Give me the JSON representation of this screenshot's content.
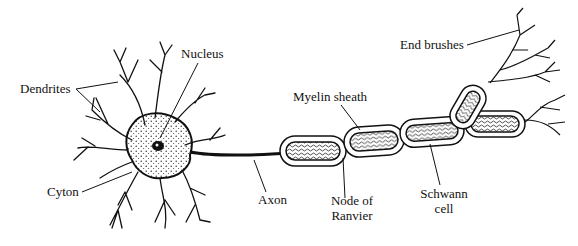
{
  "diagram": {
    "labels": {
      "nucleus": "Nucleus",
      "dendrites": "Dendrites",
      "cyton": "Cyton",
      "axon": "Axon",
      "myelin_sheath": "Myelin sheath",
      "node_of_ranvier_line1": "Node of",
      "node_of_ranvier_line2": "Ranvier",
      "schwann_cell_line1": "Schwann",
      "schwann_cell_line2": "cell",
      "end_brushes": "End brushes"
    },
    "colors": {
      "ink": "#111111",
      "background": "#ffffff"
    }
  }
}
